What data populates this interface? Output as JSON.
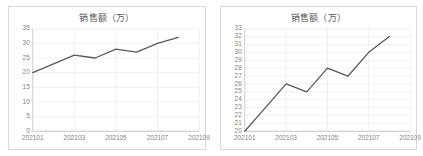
{
  "charts": [
    {
      "panel_name": "left-chart-panel",
      "title": "销售额（万）",
      "ylim": [
        0,
        35
      ],
      "ystep": 5,
      "yticks": [
        "0",
        "5",
        "10",
        "15",
        "20",
        "25",
        "30",
        "35"
      ],
      "xticks": [
        "202101",
        "202103",
        "202105",
        "202107",
        "202109"
      ]
    },
    {
      "panel_name": "right-chart-panel",
      "title": "销售额（万）",
      "ylim": [
        20,
        33
      ],
      "ystep": 1,
      "yticks": [
        "20",
        "21",
        "22",
        "23",
        "24",
        "25",
        "26",
        "27",
        "28",
        "29",
        "30",
        "31",
        "32",
        "33"
      ],
      "xticks": [
        "202101",
        "202103",
        "202105",
        "202107",
        "202109"
      ]
    }
  ],
  "chart_data": [
    {
      "type": "line",
      "title": "销售额（万）",
      "xlabel": "",
      "ylabel": "",
      "categories": [
        "202101",
        "202102",
        "202103",
        "202104",
        "202105",
        "202106",
        "202107",
        "202108"
      ],
      "values": [
        20,
        23,
        26,
        25,
        28,
        27,
        30,
        32
      ],
      "ylim": [
        0,
        35
      ],
      "ytick_step": 5,
      "yticks": [
        0,
        5,
        10,
        15,
        20,
        25,
        30,
        35
      ],
      "xtick_labels": [
        "202101",
        "202103",
        "202105",
        "202107",
        "202109"
      ],
      "grid": true,
      "legend": false,
      "series_color": "#595959"
    },
    {
      "type": "line",
      "title": "销售额（万）",
      "xlabel": "",
      "ylabel": "",
      "categories": [
        "202101",
        "202102",
        "202103",
        "202104",
        "202105",
        "202106",
        "202107",
        "202108"
      ],
      "values": [
        20,
        23,
        26,
        25,
        28,
        27,
        30,
        32
      ],
      "ylim": [
        20,
        33
      ],
      "ytick_step": 1,
      "yticks": [
        20,
        21,
        22,
        23,
        24,
        25,
        26,
        27,
        28,
        29,
        30,
        31,
        32,
        33
      ],
      "xtick_labels": [
        "202101",
        "202103",
        "202105",
        "202107",
        "202109"
      ],
      "grid": true,
      "legend": false,
      "series_color": "#595959"
    }
  ]
}
